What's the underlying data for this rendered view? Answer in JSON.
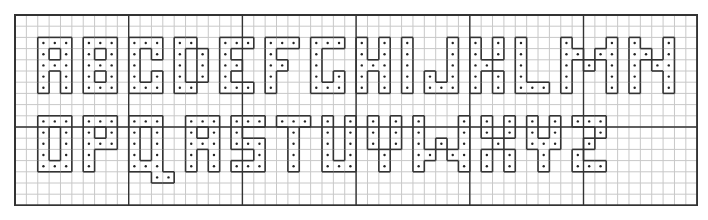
{
  "grid": {
    "cols": 60,
    "rows": 17,
    "cell_w": 11.37,
    "cell_h": 11.2,
    "major_every": 10,
    "major_row_line": 10,
    "line_color": "#c8c8c8",
    "major_color": "#333333",
    "outline_color": "#333333",
    "dot_color": "#222222"
  },
  "letters": [
    {
      "ch": "A",
      "col": 2,
      "row": 2,
      "pattern": [
        "111",
        "101",
        "111",
        "101",
        "101"
      ]
    },
    {
      "ch": "B",
      "col": 6,
      "row": 2,
      "pattern": [
        "111",
        "101",
        "111",
        "101",
        "111"
      ]
    },
    {
      "ch": "C",
      "col": 10,
      "row": 2,
      "pattern": [
        "111",
        "101",
        "100",
        "101",
        "111"
      ]
    },
    {
      "ch": "D",
      "col": 14,
      "row": 2,
      "pattern": [
        "110",
        "101",
        "101",
        "101",
        "110"
      ]
    },
    {
      "ch": "E",
      "col": 18,
      "row": 2,
      "pattern": [
        "111",
        "100",
        "110",
        "100",
        "111"
      ]
    },
    {
      "ch": "F",
      "col": 22,
      "row": 2,
      "pattern": [
        "111",
        "100",
        "110",
        "100",
        "100"
      ]
    },
    {
      "ch": "G",
      "col": 26,
      "row": 2,
      "pattern": [
        "111",
        "100",
        "100",
        "101",
        "111"
      ]
    },
    {
      "ch": "H",
      "col": 30,
      "row": 2,
      "pattern": [
        "101",
        "101",
        "111",
        "101",
        "101"
      ]
    },
    {
      "ch": "I",
      "col": 34,
      "row": 2,
      "pattern": [
        "1",
        "1",
        "1",
        "1",
        "1"
      ]
    },
    {
      "ch": "J",
      "col": 36,
      "row": 2,
      "pattern": [
        "001",
        "001",
        "001",
        "101",
        "111"
      ]
    },
    {
      "ch": "K",
      "col": 40,
      "row": 2,
      "pattern": [
        "101",
        "101",
        "110",
        "101",
        "101"
      ]
    },
    {
      "ch": "L",
      "col": 44,
      "row": 2,
      "pattern": [
        "100",
        "100",
        "100",
        "100",
        "111"
      ]
    },
    {
      "ch": "M",
      "col": 48,
      "row": 2,
      "pattern": [
        "10001",
        "11011",
        "10101",
        "10001",
        "10001"
      ]
    },
    {
      "ch": "N",
      "col": 54,
      "row": 2,
      "pattern": [
        "1001",
        "1101",
        "1011",
        "1001",
        "1001"
      ]
    },
    {
      "ch": "O",
      "col": 2,
      "row": 9,
      "pattern": [
        "111",
        "101",
        "101",
        "101",
        "111"
      ]
    },
    {
      "ch": "P",
      "col": 6,
      "row": 9,
      "pattern": [
        "111",
        "101",
        "111",
        "100",
        "100"
      ]
    },
    {
      "ch": "Q",
      "col": 10,
      "row": 9,
      "pattern": [
        "1110",
        "1010",
        "1010",
        "1010",
        "1110",
        "0011"
      ]
    },
    {
      "ch": "R",
      "col": 15,
      "row": 9,
      "pattern": [
        "111",
        "101",
        "111",
        "101",
        "101"
      ]
    },
    {
      "ch": "S",
      "col": 19,
      "row": 9,
      "pattern": [
        "111",
        "100",
        "111",
        "001",
        "111"
      ]
    },
    {
      "ch": "T",
      "col": 23,
      "row": 9,
      "pattern": [
        "111",
        "010",
        "010",
        "010",
        "010"
      ]
    },
    {
      "ch": "U",
      "col": 27,
      "row": 9,
      "pattern": [
        "101",
        "101",
        "101",
        "101",
        "111"
      ]
    },
    {
      "ch": "V",
      "col": 31,
      "row": 9,
      "pattern": [
        "101",
        "101",
        "101",
        "010",
        "010"
      ]
    },
    {
      "ch": "W",
      "col": 35,
      "row": 9,
      "pattern": [
        "10001",
        "10001",
        "10101",
        "11011",
        "10001"
      ]
    },
    {
      "ch": "X",
      "col": 41,
      "row": 9,
      "pattern": [
        "101",
        "101",
        "010",
        "101",
        "101"
      ]
    },
    {
      "ch": "Y",
      "col": 45,
      "row": 9,
      "pattern": [
        "101",
        "101",
        "111",
        "010",
        "010"
      ]
    },
    {
      "ch": "Z",
      "col": 49,
      "row": 9,
      "pattern": [
        "111",
        "001",
        "010",
        "100",
        "111"
      ]
    }
  ]
}
